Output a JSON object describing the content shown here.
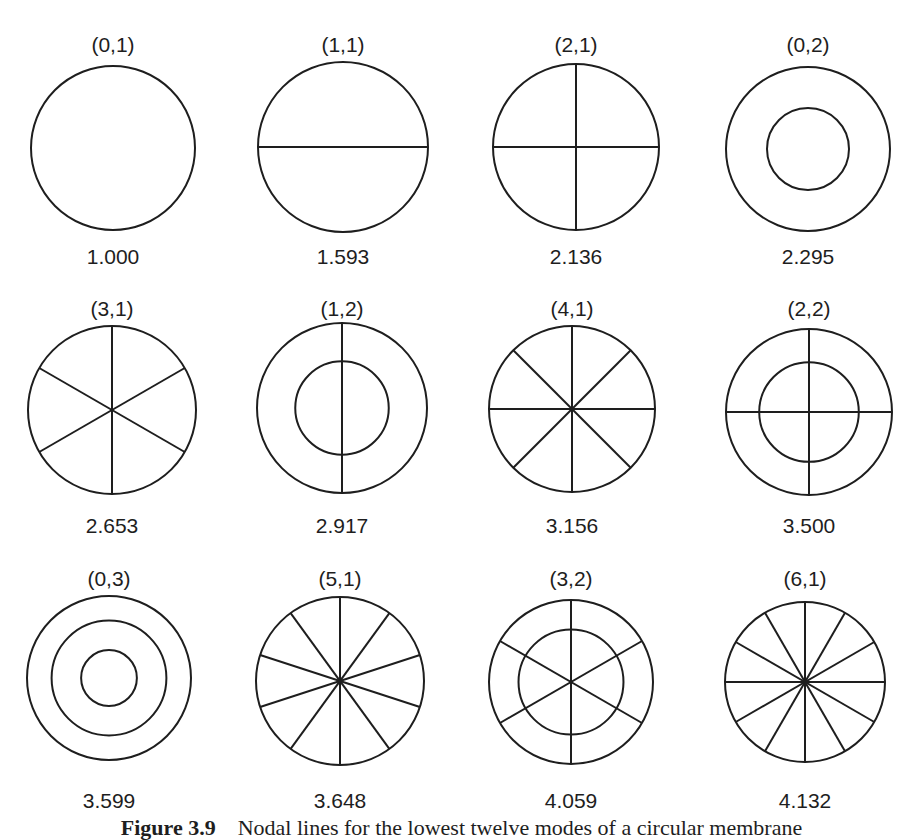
{
  "figure": {
    "caption_label": "Figure 3.9",
    "caption_text": "Nodal lines for the lowest twelve modes of a circular membrane",
    "stroke_color": "#1e1e1e",
    "background": "#ffffff"
  },
  "modes": [
    {
      "mode": "(0,1)",
      "m": 0,
      "n": 1,
      "freq": "1.000",
      "cx": 113,
      "cy": 148,
      "r": 82,
      "label_y": 34,
      "freq_y": 246,
      "rings": [],
      "diameter_offset": 0
    },
    {
      "mode": "(1,1)",
      "m": 1,
      "n": 1,
      "freq": "1.593",
      "cx": 343,
      "cy": 147,
      "r": 85,
      "label_y": 34,
      "freq_y": 246,
      "rings": [],
      "diameter_offset": 90
    },
    {
      "mode": "(2,1)",
      "m": 2,
      "n": 1,
      "freq": "2.136",
      "cx": 576,
      "cy": 147,
      "r": 83,
      "label_y": 34,
      "freq_y": 246,
      "rings": [],
      "diameter_offset": 0
    },
    {
      "mode": "(0,2)",
      "m": 0,
      "n": 2,
      "freq": "2.295",
      "cx": 808,
      "cy": 149,
      "r": 82,
      "label_y": 34,
      "freq_y": 246,
      "rings": [
        0.5
      ],
      "diameter_offset": 0
    },
    {
      "mode": "(3,1)",
      "m": 3,
      "n": 1,
      "freq": "2.653",
      "cx": 112,
      "cy": 410,
      "r": 84,
      "label_y": 298,
      "freq_y": 515,
      "rings": [],
      "diameter_offset": 0
    },
    {
      "mode": "(1,2)",
      "m": 1,
      "n": 2,
      "freq": "2.917",
      "cx": 342,
      "cy": 408,
      "r": 85,
      "label_y": 298,
      "freq_y": 515,
      "rings": [
        0.55
      ],
      "diameter_offset": 0
    },
    {
      "mode": "(4,1)",
      "m": 4,
      "n": 1,
      "freq": "3.156",
      "cx": 572,
      "cy": 409,
      "r": 83,
      "label_y": 298,
      "freq_y": 515,
      "rings": [],
      "diameter_offset": 0
    },
    {
      "mode": "(2,2)",
      "m": 2,
      "n": 2,
      "freq": "3.500",
      "cx": 809,
      "cy": 412,
      "r": 83,
      "label_y": 298,
      "freq_y": 515,
      "rings": [
        0.6
      ],
      "diameter_offset": 0
    },
    {
      "mode": "(0,3)",
      "m": 0,
      "n": 3,
      "freq": "3.599",
      "cx": 109,
      "cy": 678,
      "r": 82,
      "label_y": 568,
      "freq_y": 790,
      "rings": [
        0.7,
        0.34
      ],
      "diameter_offset": 0
    },
    {
      "mode": "(5,1)",
      "m": 5,
      "n": 1,
      "freq": "3.648",
      "cx": 340,
      "cy": 681,
      "r": 84,
      "label_y": 568,
      "freq_y": 790,
      "rings": [],
      "diameter_offset": 0
    },
    {
      "mode": "(3,2)",
      "m": 3,
      "n": 2,
      "freq": "4.059",
      "cx": 571,
      "cy": 682,
      "r": 82,
      "label_y": 568,
      "freq_y": 790,
      "rings": [
        0.64
      ],
      "diameter_offset": 0
    },
    {
      "mode": "(6,1)",
      "m": 6,
      "n": 1,
      "freq": "4.132",
      "cx": 805,
      "cy": 682,
      "r": 80,
      "label_y": 568,
      "freq_y": 790,
      "rings": [],
      "diameter_offset": 0
    }
  ]
}
